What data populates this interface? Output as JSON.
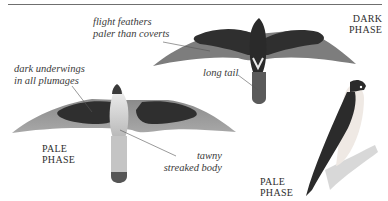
{
  "figure": {
    "annotations": {
      "flight_feathers": [
        "flight feathers",
        "paler than coverts"
      ],
      "dark_underwings": [
        "dark underwings",
        "in all plumages"
      ],
      "long_tail": "long tail",
      "tawny_body": [
        "tawny",
        "streaked body"
      ]
    },
    "phase_labels": {
      "dark_phase": [
        "DARK",
        "PHASE"
      ],
      "pale_phase_flight": [
        "PALE",
        "PHASE"
      ],
      "pale_phase_perched": [
        "PALE",
        "PHASE"
      ]
    },
    "colors": {
      "dark_plumage": "#2f2f2f",
      "mid_grey": "#7a7a7a",
      "pale_grey": "#b5b5b5",
      "background": "#ffffff"
    }
  }
}
